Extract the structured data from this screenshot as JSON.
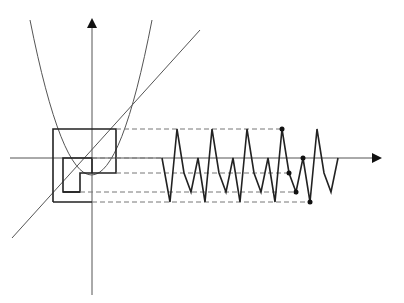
{
  "diagram": {
    "type": "cobweb-plot-with-time-series",
    "colors": {
      "stroke": "#222222",
      "guide": "#777777",
      "background": "#ffffff"
    },
    "axes": {
      "vertical": {
        "x": 92,
        "y_top": 22,
        "y_bottom": 295
      },
      "horizontal": {
        "y": 158,
        "x_left": 10,
        "x_right": 380
      }
    },
    "levels": [
      129,
      158,
      173,
      192,
      202
    ],
    "time_series": {
      "points": [
        [
          162,
          158
        ],
        [
          170,
          202
        ],
        [
          177,
          129
        ],
        [
          184,
          173
        ],
        [
          191,
          192
        ],
        [
          198,
          158
        ],
        [
          205,
          202
        ],
        [
          212,
          129
        ],
        [
          219,
          173
        ],
        [
          226,
          192
        ],
        [
          233,
          158
        ],
        [
          240,
          202
        ],
        [
          247,
          129
        ],
        [
          254,
          173
        ],
        [
          261,
          192
        ],
        [
          268,
          158
        ],
        [
          275,
          202
        ],
        [
          282,
          129
        ],
        [
          289,
          173
        ],
        [
          296,
          192
        ],
        [
          303,
          158
        ],
        [
          310,
          202
        ],
        [
          317,
          129
        ],
        [
          324,
          173
        ],
        [
          331,
          192
        ],
        [
          338,
          158
        ]
      ],
      "markers": [
        [
          282,
          129
        ],
        [
          289,
          173
        ],
        [
          296,
          192
        ],
        [
          303,
          158
        ],
        [
          310,
          202
        ]
      ]
    }
  }
}
